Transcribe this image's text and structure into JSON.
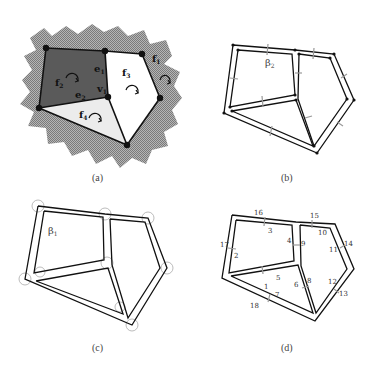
{
  "panels": {
    "a": {
      "caption": "(a)",
      "labels": {
        "f1": "f",
        "f1s": "1",
        "f2": "f",
        "f2s": "2",
        "f3": "f",
        "f3s": "3",
        "f4": "f",
        "f4s": "4",
        "e1": "e",
        "e1s": "1",
        "e2": "e",
        "e2s": "2",
        "v1": "v",
        "v1s": "1"
      },
      "colors": {
        "f2_fill": "#555555",
        "f4_fill": "#e8e8e8",
        "f3_fill": "#ffffff",
        "exterior": "#9a9a9a"
      }
    },
    "b": {
      "caption": "(b)",
      "label": "β",
      "label_sub": "2"
    },
    "c": {
      "caption": "(c)",
      "label": "β",
      "label_sub": "1"
    },
    "d": {
      "caption": "(d)",
      "edge_numbers": [
        "1",
        "2",
        "3",
        "4",
        "5",
        "6",
        "7",
        "8",
        "9",
        "10",
        "11",
        "12",
        "13",
        "14",
        "15",
        "16",
        "17",
        "18"
      ]
    }
  }
}
